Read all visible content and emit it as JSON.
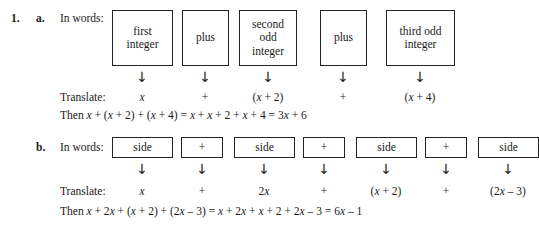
{
  "problem": {
    "number": "1.",
    "parts": [
      {
        "letter": "a.",
        "in_words_label": "In words:",
        "translate_label": "Translate:",
        "boxes": [
          {
            "lines": [
              "first",
              "integer"
            ]
          },
          {
            "lines": [
              "plus"
            ]
          },
          {
            "lines": [
              "second",
              "odd",
              "integer"
            ]
          },
          {
            "lines": [
              "plus"
            ]
          },
          {
            "lines": [
              "third odd",
              "integer"
            ]
          }
        ],
        "arrows": [
          "down-arrow",
          "down-arrow",
          "down-arrow",
          "down-arrow",
          "down-arrow"
        ],
        "translations": [
          "x",
          "+",
          "(x + 2)",
          "+",
          "(x + 4)"
        ],
        "then_prefix": "Then ",
        "then_expression": "x + (x + 2) + (x + 4) = x + x + 2 + x + 4 = 3x + 6"
      },
      {
        "letter": "b.",
        "in_words_label": "In words:",
        "translate_label": "Translate:",
        "boxes": [
          {
            "lines": [
              "side"
            ]
          },
          {
            "lines": [
              "+"
            ]
          },
          {
            "lines": [
              "side"
            ]
          },
          {
            "lines": [
              "+"
            ]
          },
          {
            "lines": [
              "side"
            ]
          },
          {
            "lines": [
              "+"
            ]
          },
          {
            "lines": [
              "side"
            ]
          }
        ],
        "arrows": [
          "down-arrow",
          "down-arrow",
          "down-arrow",
          "down-arrow",
          "down-arrow",
          "down-arrow",
          "down-arrow"
        ],
        "translations": [
          "x",
          "+",
          "2x",
          "+",
          "(x + 2)",
          "+",
          "(2x – 3)"
        ],
        "then_prefix": "Then ",
        "then_expression": "x + 2x + (x + 2) + (2x – 3) = x + 2x + x + 2 + 2x – 3 = 6x – 1"
      }
    ]
  },
  "icons": {
    "down_arrow_glyph": "↓"
  },
  "colors": {
    "text": "#1a1a1a",
    "box_border": "#232323",
    "page_background": "#ffffff"
  }
}
